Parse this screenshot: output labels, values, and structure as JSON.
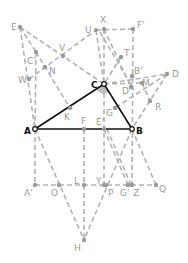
{
  "diagram": {
    "type": "geometry-construction",
    "triangle": [
      "A",
      "B",
      "C"
    ],
    "colors": {
      "main": "#111111",
      "auxiliary": "#b3b3b3",
      "label": "#9a9a9a",
      "background": "#ffffff"
    },
    "points": {
      "E": {
        "label": "E",
        "x": 20,
        "y": 27
      },
      "U": {
        "label": "U",
        "x": 96,
        "y": 30
      },
      "X": {
        "label": "X",
        "x": 104,
        "y": 29
      },
      "Fp": {
        "label": "F'",
        "x": 133,
        "y": 29
      },
      "V": {
        "label": "V",
        "x": 63,
        "y": 56
      },
      "Cp": {
        "label": "C'",
        "x": 36,
        "y": 52
      },
      "W": {
        "label": "W",
        "x": 29,
        "y": 79
      },
      "N": {
        "label": "N",
        "x": 45,
        "y": 67
      },
      "T": {
        "label": "T",
        "x": 121,
        "y": 57
      },
      "Bp": {
        "label": "B'",
        "x": 132,
        "y": 76
      },
      "D": {
        "label": "D",
        "x": 167,
        "y": 74
      },
      "M": {
        "label": "M",
        "x": 142,
        "y": 83
      },
      "Dp": {
        "label": "D'",
        "x": 131,
        "y": 87
      },
      "C": {
        "label": "C",
        "x": 104,
        "y": 84
      },
      "R": {
        "label": "R",
        "x": 150,
        "y": 101
      },
      "K": {
        "label": "K",
        "x": 70,
        "y": 108
      },
      "G": {
        "label": "G",
        "x": 115,
        "y": 108
      },
      "A": {
        "label": "A",
        "x": 35,
        "y": 129
      },
      "F": {
        "label": "F",
        "x": 84,
        "y": 129
      },
      "Ep": {
        "label": "E'",
        "x": 104,
        "y": 129
      },
      "B": {
        "label": "B",
        "x": 132,
        "y": 129
      },
      "Ap": {
        "label": "A'",
        "x": 35,
        "y": 185
      },
      "O": {
        "label": "O",
        "x": 59,
        "y": 185
      },
      "L": {
        "label": "L",
        "x": 84,
        "y": 185
      },
      "Y": {
        "label": "Y",
        "x": 104,
        "y": 185
      },
      "P": {
        "label": "P",
        "x": 106,
        "y": 185
      },
      "Gp": {
        "label": "G'",
        "x": 128,
        "y": 185
      },
      "Z": {
        "label": "Z",
        "x": 132,
        "y": 185
      },
      "Q": {
        "label": "Q",
        "x": 156,
        "y": 185
      },
      "H": {
        "label": "H",
        "x": 84,
        "y": 240
      }
    }
  }
}
